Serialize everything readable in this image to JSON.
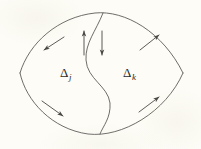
{
  "figure": {
    "background_color": "#fdfcf6",
    "ink_color": "#55534e",
    "label_color": "#2b2b2b",
    "width": 201,
    "height": 149,
    "caption": "",
    "regions": [
      {
        "id": "delta-j",
        "symbol": "Δ",
        "subscript": "j",
        "position": "left",
        "x": 60,
        "y": 66
      },
      {
        "id": "delta-k",
        "symbol": "Δ",
        "subscript": "k",
        "position": "right",
        "x": 123,
        "y": 66
      }
    ],
    "outline": {
      "shape": "lens",
      "left_vertex": [
        20,
        73
      ],
      "right_vertex": [
        183,
        73
      ],
      "top_apex": [
        103,
        13
      ],
      "bottom_apex": [
        100,
        134
      ]
    },
    "divider": {
      "shape": "s-curve",
      "start": [
        103,
        13
      ],
      "end": [
        100,
        134
      ]
    },
    "arrows": [
      {
        "id": "arrow-top-left-inner",
        "direction": "up",
        "x1": 84,
        "y1": 55,
        "x2": 84,
        "y2": 31
      },
      {
        "id": "arrow-top-right-inner",
        "direction": "down",
        "x1": 102,
        "y1": 31,
        "x2": 102,
        "y2": 55
      },
      {
        "id": "arrow-upper-left",
        "direction": "down-left",
        "x1": 64,
        "y1": 37,
        "x2": 44,
        "y2": 50
      },
      {
        "id": "arrow-upper-right",
        "direction": "up-right",
        "x1": 140,
        "y1": 50,
        "x2": 159,
        "y2": 35
      },
      {
        "id": "arrow-lower-left",
        "direction": "down-right",
        "x1": 42,
        "y1": 101,
        "x2": 63,
        "y2": 116
      },
      {
        "id": "arrow-lower-right",
        "direction": "up-right",
        "x1": 139,
        "y1": 112,
        "x2": 159,
        "y2": 97
      }
    ]
  }
}
